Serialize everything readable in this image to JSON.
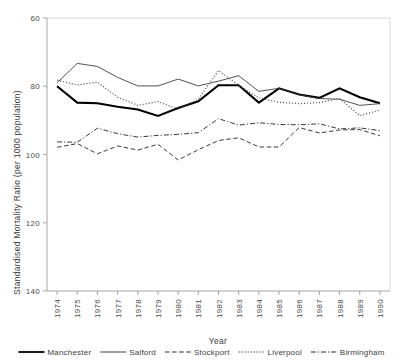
{
  "chart_data": {
    "type": "line",
    "title": "",
    "xlabel": "Year",
    "ylabel": "Standardised Mortality Ratio (per 1000 population)",
    "ylim": [
      60,
      140
    ],
    "yticks": [
      60,
      80,
      100,
      120,
      140
    ],
    "grid": false,
    "legend_position": "bottom",
    "categories": [
      "1974",
      "1975",
      "1976",
      "1977",
      "1978",
      "1979",
      "1980",
      "1981",
      "1982",
      "1983",
      "1984",
      "1985",
      "1986",
      "1987",
      "1988",
      "1989",
      "1990"
    ],
    "series": [
      {
        "name": "Manchester",
        "style": "solid-thick",
        "color": "#000000",
        "values": [
          120.0,
          115.2,
          115.0,
          114.0,
          113.2,
          111.3,
          113.6,
          115.6,
          120.3,
          120.3,
          115.2,
          119.4,
          117.6,
          116.6,
          119.4,
          116.8,
          115.0
        ]
      },
      {
        "name": "Salford",
        "style": "solid-thin",
        "color": "#333333",
        "values": [
          121.0,
          126.7,
          125.8,
          122.6,
          120.1,
          120.1,
          122.1,
          120.1,
          121.5,
          123.1,
          118.5,
          119.4,
          117.5,
          116.4,
          116.2,
          114.4,
          114.9
        ]
      },
      {
        "name": "Stockport",
        "style": "dashed",
        "color": "#2e2e2e",
        "values": [
          102.1,
          103.2,
          100.2,
          102.5,
          101.3,
          103.0,
          98.4,
          101.4,
          104.1,
          104.9,
          102.2,
          102.2,
          107.9,
          106.3,
          107.2,
          107.3,
          105.5
        ]
      },
      {
        "name": "Liverpool",
        "style": "dotted",
        "color": "#555555",
        "values": [
          121.8,
          120.4,
          121.2,
          116.8,
          114.4,
          115.5,
          113.3,
          116.2,
          124.6,
          120.3,
          116.6,
          115.3,
          114.9,
          115.2,
          116.4,
          111.4,
          113.0
        ]
      },
      {
        "name": "Birmingham",
        "style": "dash-dot",
        "color": "#2e2e2e",
        "values": [
          103.7,
          103.6,
          107.7,
          106.1,
          105.1,
          105.6,
          105.9,
          106.4,
          110.5,
          108.6,
          109.3,
          108.8,
          108.7,
          109.0,
          107.5,
          107.8,
          107.0
        ]
      }
    ]
  },
  "axes": {
    "y_tick_labels": [
      "140",
      "120",
      "100",
      "80",
      "60"
    ],
    "y_axis_title": "Standardised Mortality Ratio (per 1000 population)",
    "x_tick_labels": [
      "1974",
      "1975",
      "1976",
      "1977",
      "1978",
      "1979",
      "1980",
      "1981",
      "1982",
      "1983",
      "1984",
      "1985",
      "1986",
      "1987",
      "1988",
      "1989",
      "1990"
    ],
    "x_axis_title": "Year"
  },
  "legend": {
    "items": [
      {
        "label": "Manchester",
        "style": "solid-thick"
      },
      {
        "label": "Salford",
        "style": "solid-thin"
      },
      {
        "label": "Stockport",
        "style": "dashed"
      },
      {
        "label": "Liverpool",
        "style": "dotted"
      },
      {
        "label": "Birmingham",
        "style": "dash-dot"
      }
    ]
  }
}
